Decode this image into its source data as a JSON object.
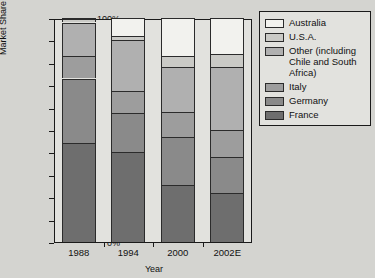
{
  "chart_data": {
    "type": "bar",
    "subtype": "stacked-percentage",
    "title": "",
    "xlabel": "Year",
    "ylabel": "Market Share",
    "categories": [
      "1988",
      "1994",
      "2000",
      "2002E"
    ],
    "ylim": [
      0,
      100
    ],
    "ytick_labels": [
      "0%",
      "10%",
      "20%",
      "30%",
      "40%",
      "50%",
      "60%",
      "70%",
      "80%",
      "90%",
      "100%"
    ],
    "ytick_values": [
      0,
      10,
      20,
      30,
      40,
      50,
      60,
      70,
      80,
      90,
      100
    ],
    "grid": false,
    "legend_position": "right",
    "series": [
      {
        "name": "France",
        "color": "#6e6e6e",
        "values": [
          44,
          40,
          25.5,
          22
        ]
      },
      {
        "name": "Germany",
        "color": "#8a8a8a",
        "values": [
          29,
          17.5,
          21.5,
          16
        ]
      },
      {
        "name": "Italy",
        "color": "#9d9d9d",
        "values": [
          10,
          10,
          11,
          12
        ]
      },
      {
        "name": "Other (including Chile and South Africa)",
        "color": "#b0b0b0",
        "values": [
          15,
          22.5,
          20,
          28
        ]
      },
      {
        "name": "U.S.A.",
        "color": "#cacac6",
        "values": [
          1.5,
          2,
          5,
          6
        ]
      },
      {
        "name": "Australia",
        "color": "#f2f2ee",
        "values": [
          0.5,
          8,
          17,
          16
        ]
      }
    ]
  },
  "legend": {
    "items": [
      {
        "label": "Australia",
        "color": "#f2f2ee"
      },
      {
        "label": "U.S.A.",
        "color": "#cacac6"
      },
      {
        "label": "Other (including Chile and South Africa)",
        "color": "#b0b0b0"
      },
      {
        "label": "Italy",
        "color": "#9d9d9d"
      },
      {
        "label": "Germany",
        "color": "#8a8a8a"
      },
      {
        "label": "France",
        "color": "#6e6e6e"
      }
    ]
  }
}
